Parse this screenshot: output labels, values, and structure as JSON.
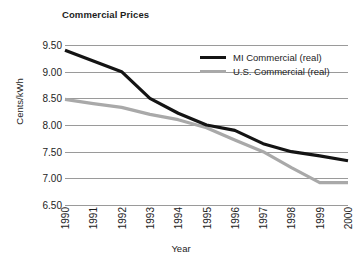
{
  "chart_data": {
    "type": "line",
    "title": "Commercial Prices",
    "xlabel": "Year",
    "ylabel": "Cents/kWh",
    "categories": [
      "1990",
      "1991",
      "1992",
      "1993",
      "1994",
      "1995",
      "1996",
      "1997",
      "1998",
      "1999",
      "2000"
    ],
    "ylim": [
      6.5,
      9.5
    ],
    "yticks": [
      "6.50",
      "7.00",
      "7.50",
      "8.00",
      "8.50",
      "9.00",
      "9.50"
    ],
    "ytick_values": [
      6.5,
      7.0,
      7.5,
      8.0,
      8.5,
      9.0,
      9.5
    ],
    "grid": "horizontal",
    "legend_position": "upper-right-inside",
    "series": [
      {
        "name": "MI Commercial (real)",
        "color": "#141414",
        "values": [
          9.4,
          9.2,
          9.0,
          8.5,
          8.22,
          8.0,
          7.9,
          7.65,
          7.5,
          7.42,
          7.33
        ]
      },
      {
        "name": "U.S. Commercial (real)",
        "color": "#a9a9a9",
        "values": [
          8.48,
          8.4,
          8.33,
          8.2,
          8.1,
          7.95,
          7.72,
          7.5,
          7.2,
          6.92,
          6.92
        ]
      }
    ]
  },
  "colors": {
    "background": "#ffffff",
    "gridline": "#9a9a9a",
    "text": "#1d1d1d",
    "series_mi": "#141414",
    "series_us": "#a9a9a9"
  }
}
